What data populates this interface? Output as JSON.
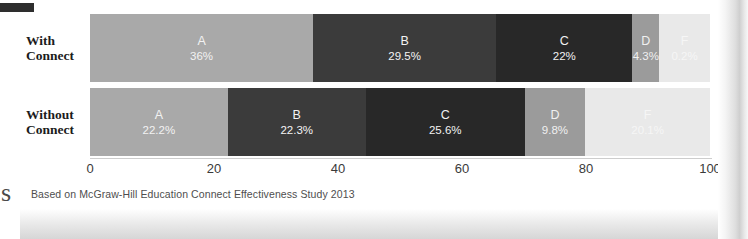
{
  "caption": "Based on McGraw-Hill Education Connect Effectiveness Study 2013",
  "corner_mark": "page-corner-mark",
  "bleed_glyph": "s",
  "axis": {
    "ticks": [
      "0",
      "20",
      "40",
      "60",
      "80",
      "100"
    ],
    "min": 0,
    "max": 100
  },
  "rows": [
    {
      "label_line1": "With",
      "label_line2": "Connect",
      "segments": [
        {
          "letter": "A",
          "value": "36%",
          "pct": 36.0,
          "tone": "tone-a"
        },
        {
          "letter": "B",
          "value": "29.5%",
          "pct": 29.5,
          "tone": "tone-b"
        },
        {
          "letter": "C",
          "value": "22%",
          "pct": 22.0,
          "tone": "tone-c"
        },
        {
          "letter": "D",
          "value": "4.3%",
          "pct": 4.3,
          "tone": "tone-d"
        },
        {
          "letter": "F",
          "value": "0.2%",
          "pct": 8.2,
          "tone": "tone-f"
        }
      ]
    },
    {
      "label_line1": "Without",
      "label_line2": "Connect",
      "segments": [
        {
          "letter": "A",
          "value": "22.2%",
          "pct": 22.2,
          "tone": "tone-a"
        },
        {
          "letter": "B",
          "value": "22.3%",
          "pct": 22.3,
          "tone": "tone-b"
        },
        {
          "letter": "C",
          "value": "25.6%",
          "pct": 25.6,
          "tone": "tone-c"
        },
        {
          "letter": "D",
          "value": "9.8%",
          "pct": 9.8,
          "tone": "tone-d"
        },
        {
          "letter": "F",
          "value": "20.1%",
          "pct": 20.1,
          "tone": "tone-f"
        }
      ]
    }
  ],
  "chart_data": {
    "type": "bar",
    "orientation": "horizontal",
    "stacked": true,
    "title": "",
    "subtitle": "",
    "xlabel": "",
    "ylabel": "",
    "xlim": [
      0,
      100
    ],
    "xticks": [
      0,
      20,
      40,
      60,
      80,
      100
    ],
    "grid": false,
    "legend": "none",
    "categories": [
      "With Connect",
      "Without Connect"
    ],
    "series": [
      {
        "name": "A",
        "values": [
          36.0,
          22.2
        ],
        "labels": [
          "36%",
          "22.2%"
        ],
        "color": "#a9a9a9"
      },
      {
        "name": "B",
        "values": [
          29.5,
          22.3
        ],
        "labels": [
          "29.5%",
          "22.3%"
        ],
        "color": "#3b3b3b"
      },
      {
        "name": "C",
        "values": [
          22.0,
          25.6
        ],
        "labels": [
          "22%",
          "25.6%"
        ],
        "color": "#282828"
      },
      {
        "name": "D",
        "values": [
          4.3,
          9.8
        ],
        "labels": [
          "4.3%",
          "9.8%"
        ],
        "color": "#9b9b9b"
      },
      {
        "name": "F",
        "values": [
          8.2,
          20.1
        ],
        "labels": [
          "0.2%",
          "20.1%"
        ],
        "color": "#e9e9e9"
      }
    ],
    "annotations": [
      "Based on McGraw-Hill Education Connect Effectiveness Study 2013"
    ]
  }
}
